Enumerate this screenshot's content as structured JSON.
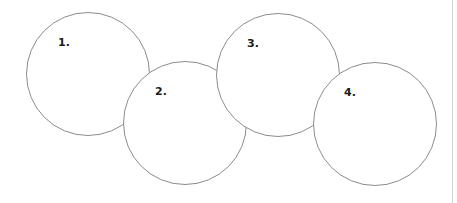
{
  "diagram": {
    "type": "overlapping-circles-chain",
    "stroke_color": "#8c8c8c",
    "fill_color": "#ffffff",
    "label_color": "#1a1a1a",
    "circles": [
      {
        "label": "1.",
        "cx": 88,
        "cy": 74,
        "r": 62,
        "label_x": 58,
        "label_y": 37
      },
      {
        "label": "2.",
        "cx": 185,
        "cy": 123,
        "r": 62,
        "label_x": 155,
        "label_y": 86
      },
      {
        "label": "3.",
        "cx": 278,
        "cy": 75,
        "r": 62,
        "label_x": 247,
        "label_y": 38
      },
      {
        "label": "4.",
        "cx": 375,
        "cy": 124,
        "r": 62,
        "label_x": 344,
        "label_y": 87
      }
    ]
  },
  "frame": {
    "right_rule_x": 452,
    "right_rule_color": "#d4d4d4"
  }
}
